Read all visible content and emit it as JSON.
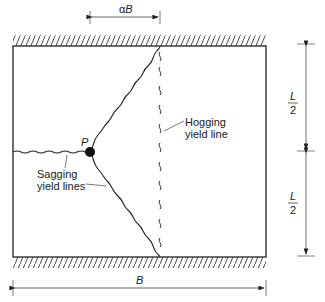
{
  "figure": {
    "dimensions": {
      "alpha_B": "αB",
      "B": "B",
      "L_top_num": "L",
      "L_top_den": "2",
      "L_bot_num": "L",
      "L_bot_den": "2"
    },
    "labels": {
      "point": "P",
      "hogging_line1": "Hogging",
      "hogging_line2": "yield line",
      "sagging_line1": "Sagging",
      "sagging_line2": "yield lines"
    },
    "colors": {
      "line": "#1a1a1a",
      "dim": "#555555",
      "background": "#ffffff"
    }
  }
}
